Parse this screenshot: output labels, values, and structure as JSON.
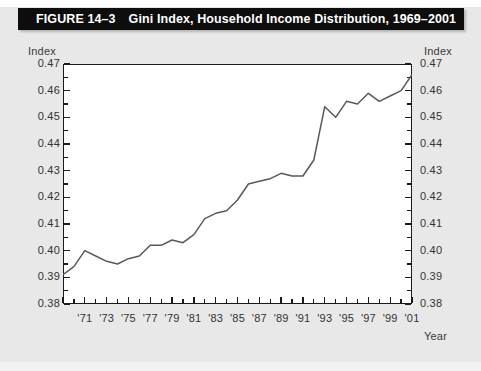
{
  "figure": {
    "number_label": "FIGURE 14–3",
    "title": "Gini Index, Household Income Distribution, 1969–2001"
  },
  "axes": {
    "left_caption": "Index",
    "right_caption": "Index",
    "x_caption": "Year",
    "y_tick_labels": [
      "0.47",
      "0.46",
      "0.45",
      "0.44",
      "0.43",
      "0.42",
      "0.41",
      "0.40",
      "0.39",
      "0.38"
    ],
    "x_tick_labels": [
      "'71",
      "'73",
      "'75",
      "'77",
      "'79",
      "'81",
      "'83",
      "'85",
      "'87",
      "'89",
      "'91",
      "'93",
      "'95",
      "'97",
      "'99",
      "'01"
    ]
  },
  "colors": {
    "title_bar": "#0d0d0d",
    "title_text": "#ffffff",
    "page_background": "#e8e8e8",
    "plot_background": "#ffffff",
    "axis_line": "#1a1a1a",
    "data_line": "#595959"
  },
  "chart_data": {
    "type": "line",
    "title": "Gini Index, Household Income Distribution, 1969–2001",
    "xlabel": "Year",
    "ylabel": "Index",
    "ylim": [
      0.38,
      0.47
    ],
    "xlim": [
      1969,
      2001
    ],
    "grid": false,
    "legend": null,
    "y_ticks": [
      0.38,
      0.39,
      0.4,
      0.41,
      0.42,
      0.43,
      0.44,
      0.45,
      0.46,
      0.47
    ],
    "x_ticks": [
      1971,
      1973,
      1975,
      1977,
      1979,
      1981,
      1983,
      1985,
      1987,
      1989,
      1991,
      1993,
      1995,
      1997,
      1999,
      2001
    ],
    "x": [
      1969,
      1970,
      1971,
      1972,
      1973,
      1974,
      1975,
      1976,
      1977,
      1978,
      1979,
      1980,
      1981,
      1982,
      1983,
      1984,
      1985,
      1986,
      1987,
      1988,
      1989,
      1990,
      1991,
      1992,
      1993,
      1994,
      1995,
      1996,
      1997,
      1998,
      1999,
      2000,
      2001
    ],
    "values": [
      0.391,
      0.394,
      0.4,
      0.398,
      0.396,
      0.395,
      0.397,
      0.398,
      0.402,
      0.402,
      0.404,
      0.403,
      0.406,
      0.412,
      0.414,
      0.415,
      0.419,
      0.425,
      0.426,
      0.427,
      0.429,
      0.428,
      0.428,
      0.434,
      0.454,
      0.45,
      0.456,
      0.455,
      0.459,
      0.456,
      0.458,
      0.46,
      0.466
    ],
    "series": [
      {
        "name": "Gini Index",
        "values": [
          0.391,
          0.394,
          0.4,
          0.398,
          0.396,
          0.395,
          0.397,
          0.398,
          0.402,
          0.402,
          0.404,
          0.403,
          0.406,
          0.412,
          0.414,
          0.415,
          0.419,
          0.425,
          0.426,
          0.427,
          0.429,
          0.428,
          0.428,
          0.434,
          0.454,
          0.45,
          0.456,
          0.455,
          0.459,
          0.456,
          0.458,
          0.46,
          0.466
        ]
      }
    ]
  }
}
